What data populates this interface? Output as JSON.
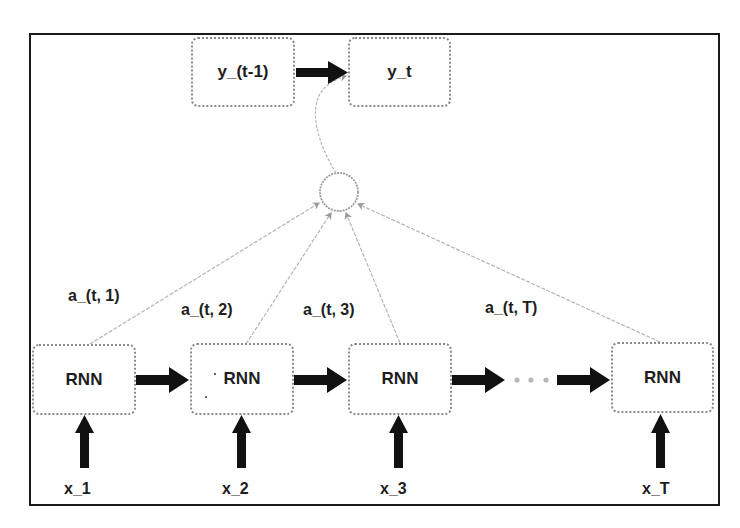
{
  "diagram": {
    "title": "",
    "outputs": [
      {
        "id": "y_prev",
        "label": "y_(t-1)"
      },
      {
        "id": "y_t",
        "label": "y_t"
      }
    ],
    "attention_node": {
      "label": "",
      "shape": "circle"
    },
    "encoder_cells": [
      {
        "id": "rnn_1",
        "label": "RNN",
        "input": "x_1",
        "attention_weight": "a_(t, 1)"
      },
      {
        "id": "rnn_2",
        "label": "RNN",
        "input": "x_2",
        "attention_weight": "a_(t, 2)"
      },
      {
        "id": "rnn_3",
        "label": "RNN",
        "input": "x_3",
        "attention_weight": "a_(t, 3)"
      },
      {
        "id": "rnn_T",
        "label": "RNN",
        "input": "x_T",
        "attention_weight": "a_(t, T)"
      }
    ],
    "ellipsis": "· · ·",
    "edges": [
      {
        "from": "y_(t-1)",
        "to": "y_t",
        "style": "thick"
      },
      {
        "from": "attention_node",
        "to": "y_t",
        "style": "thin-curved"
      },
      {
        "from": "RNN 1",
        "to": "attention_node",
        "label": "a_(t, 1)",
        "style": "thin-dashed"
      },
      {
        "from": "RNN 2",
        "to": "attention_node",
        "label": "a_(t, 2)",
        "style": "thin-dashed"
      },
      {
        "from": "RNN 3",
        "to": "attention_node",
        "label": "a_(t, 3)",
        "style": "thin-dashed"
      },
      {
        "from": "RNN T",
        "to": "attention_node",
        "label": "a_(t, T)",
        "style": "thin-dashed"
      },
      {
        "from": "RNN 1",
        "to": "RNN 2",
        "style": "thick"
      },
      {
        "from": "RNN 2",
        "to": "RNN 3",
        "style": "thick"
      },
      {
        "from": "RNN 3",
        "to": "ellipsis",
        "style": "thick"
      },
      {
        "from": "ellipsis",
        "to": "RNN T",
        "style": "thick"
      },
      {
        "from": "x_1",
        "to": "RNN 1",
        "style": "thick"
      },
      {
        "from": "x_2",
        "to": "RNN 2",
        "style": "thick"
      },
      {
        "from": "x_3",
        "to": "RNN 3",
        "style": "thick"
      },
      {
        "from": "x_T",
        "to": "RNN T",
        "style": "thick"
      }
    ]
  },
  "colors": {
    "frame": "#1a1a1a",
    "node_border": "#8a8a8a",
    "thick_arrow": "#111111",
    "thin_line": "#b0b0b0",
    "text": "#1e1e1e"
  }
}
